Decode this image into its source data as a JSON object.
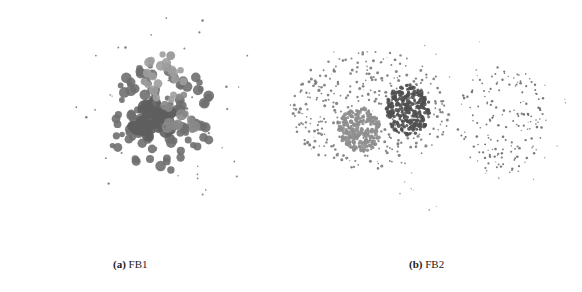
{
  "figure": {
    "panels": [
      {
        "id": "a",
        "label": "(a)",
        "name": "FB1",
        "clusters": [
          {
            "cx": 100,
            "cy": 118,
            "rx": 55,
            "ry": 55,
            "n": 110,
            "rmin": 2.5,
            "rmax": 5.5,
            "color": "#6f6f6f",
            "seed": 3
          },
          {
            "cx": 92,
            "cy": 120,
            "rx": 22,
            "ry": 18,
            "n": 40,
            "rmin": 4,
            "rmax": 7,
            "color": "#5e5e5e",
            "seed": 7
          },
          {
            "cx": 108,
            "cy": 78,
            "rx": 28,
            "ry": 25,
            "n": 22,
            "rmin": 3,
            "rmax": 5,
            "color": "#9d9d9d",
            "seed": 11
          },
          {
            "cx": 120,
            "cy": 115,
            "rx": 18,
            "ry": 22,
            "n": 14,
            "rmin": 3,
            "rmax": 6,
            "color": "#888888",
            "seed": 13
          },
          {
            "cx": 110,
            "cy": 110,
            "rx": 95,
            "ry": 100,
            "n": 40,
            "rmin": 0.7,
            "rmax": 1.4,
            "color": "#777777",
            "seed": 17
          }
        ]
      },
      {
        "id": "b",
        "label": "(b)",
        "name": "FB2",
        "clusters": [
          {
            "cx": 90,
            "cy": 70,
            "rx": 80,
            "ry": 60,
            "n": 360,
            "rmin": 0.8,
            "rmax": 1.6,
            "color": "#7a7a7a",
            "seed": 19
          },
          {
            "cx": 80,
            "cy": 90,
            "rx": 22,
            "ry": 22,
            "n": 220,
            "rmin": 1.3,
            "rmax": 2.2,
            "color": "#8e8e8e",
            "seed": 23
          },
          {
            "cx": 128,
            "cy": 70,
            "rx": 22,
            "ry": 25,
            "n": 240,
            "rmin": 1.3,
            "rmax": 2.2,
            "color": "#4f4f4f",
            "seed": 29
          },
          {
            "cx": 222,
            "cy": 80,
            "rx": 45,
            "ry": 55,
            "n": 150,
            "rmin": 0.7,
            "rmax": 1.3,
            "color": "#6a6a6a",
            "seed": 31
          },
          {
            "cx": 150,
            "cy": 80,
            "rx": 150,
            "ry": 90,
            "n": 50,
            "rmin": 0.5,
            "rmax": 0.9,
            "color": "#999999",
            "seed": 37
          }
        ]
      }
    ]
  }
}
